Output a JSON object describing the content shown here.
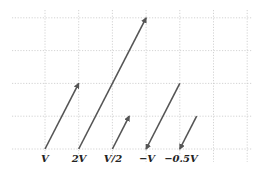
{
  "diagram": {
    "grid": {
      "columns": 7,
      "rows": 4
    },
    "base_vector": {
      "dx": 1,
      "dy": 2
    },
    "vectors": [
      {
        "label": "V",
        "scale": 1
      },
      {
        "label": "2V",
        "scale": 2
      },
      {
        "label": "V/2",
        "scale": 0.5
      },
      {
        "label": "−V",
        "scale": -1
      },
      {
        "label": "−0.5V",
        "scale": -0.5
      }
    ],
    "colors": {
      "vector": "#555555",
      "grid": "#c8c8c8",
      "label": "#222222"
    }
  }
}
